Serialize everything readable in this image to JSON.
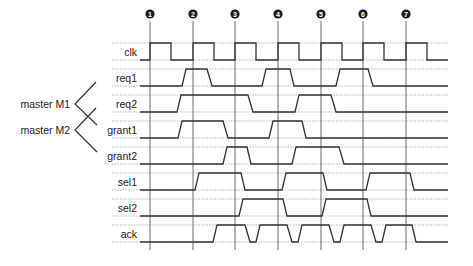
{
  "diagram": {
    "type": "timing-diagram",
    "markers": [
      {
        "label": "1",
        "x": 150
      },
      {
        "label": "2",
        "x": 193
      },
      {
        "label": "3",
        "x": 235
      },
      {
        "label": "4",
        "x": 278
      },
      {
        "label": "5",
        "x": 321
      },
      {
        "label": "6",
        "x": 363
      },
      {
        "label": "7",
        "x": 406
      }
    ],
    "x_start": 140,
    "x_end": 448,
    "groups": [
      {
        "label": "master M1",
        "signals": [
          "req1",
          "grant1"
        ]
      },
      {
        "label": "master M2",
        "signals": [
          "req2",
          "grant2"
        ]
      }
    ],
    "signals": [
      {
        "name": "clk",
        "high_y": 43,
        "low_y": 60,
        "edges": [
          [
            140,
            0
          ],
          [
            150,
            0
          ],
          [
            150,
            1
          ],
          [
            171,
            1
          ],
          [
            171,
            0
          ],
          [
            193,
            0
          ],
          [
            193,
            1
          ],
          [
            214,
            1
          ],
          [
            214,
            0
          ],
          [
            235,
            0
          ],
          [
            235,
            1
          ],
          [
            256,
            1
          ],
          [
            256,
            0
          ],
          [
            278,
            0
          ],
          [
            278,
            1
          ],
          [
            299,
            1
          ],
          [
            299,
            0
          ],
          [
            321,
            0
          ],
          [
            321,
            1
          ],
          [
            342,
            1
          ],
          [
            342,
            0
          ],
          [
            363,
            0
          ],
          [
            363,
            1
          ],
          [
            384,
            1
          ],
          [
            384,
            0
          ],
          [
            406,
            0
          ],
          [
            406,
            1
          ],
          [
            427,
            1
          ],
          [
            427,
            0
          ],
          [
            448,
            0
          ]
        ]
      },
      {
        "name": "req1",
        "high_y": 69,
        "low_y": 86,
        "edges": [
          [
            140,
            0
          ],
          [
            182,
            0
          ],
          [
            186,
            1
          ],
          [
            207,
            1
          ],
          [
            212,
            0
          ],
          [
            262,
            0
          ],
          [
            266,
            1
          ],
          [
            290,
            1
          ],
          [
            294,
            0
          ],
          [
            336,
            0
          ],
          [
            340,
            1
          ],
          [
            368,
            1
          ],
          [
            373,
            0
          ],
          [
            448,
            0
          ]
        ]
      },
      {
        "name": "req2",
        "high_y": 95,
        "low_y": 112,
        "edges": [
          [
            140,
            0
          ],
          [
            177,
            0
          ],
          [
            181,
            1
          ],
          [
            248,
            1
          ],
          [
            253,
            0
          ],
          [
            295,
            0
          ],
          [
            299,
            1
          ],
          [
            331,
            1
          ],
          [
            336,
            0
          ],
          [
            448,
            0
          ]
        ]
      },
      {
        "name": "grant1",
        "high_y": 121,
        "low_y": 138,
        "edges": [
          [
            140,
            0
          ],
          [
            178,
            0
          ],
          [
            182,
            1
          ],
          [
            223,
            1
          ],
          [
            228,
            0
          ],
          [
            269,
            0
          ],
          [
            273,
            1
          ],
          [
            302,
            1
          ],
          [
            306,
            0
          ],
          [
            448,
            0
          ]
        ]
      },
      {
        "name": "grant2",
        "high_y": 147,
        "low_y": 164,
        "edges": [
          [
            140,
            0
          ],
          [
            223,
            0
          ],
          [
            227,
            1
          ],
          [
            247,
            1
          ],
          [
            251,
            0
          ],
          [
            292,
            0
          ],
          [
            296,
            1
          ],
          [
            339,
            1
          ],
          [
            344,
            0
          ],
          [
            448,
            0
          ]
        ]
      },
      {
        "name": "sel1",
        "high_y": 173,
        "low_y": 190,
        "edges": [
          [
            140,
            0
          ],
          [
            195,
            0
          ],
          [
            199,
            1
          ],
          [
            241,
            1
          ],
          [
            245,
            0
          ],
          [
            282,
            0
          ],
          [
            286,
            1
          ],
          [
            323,
            1
          ],
          [
            327,
            0
          ],
          [
            366,
            0
          ],
          [
            370,
            1
          ],
          [
            410,
            1
          ],
          [
            414,
            0
          ],
          [
            448,
            0
          ]
        ]
      },
      {
        "name": "sel2",
        "high_y": 199,
        "low_y": 216,
        "edges": [
          [
            140,
            0
          ],
          [
            239,
            0
          ],
          [
            243,
            1
          ],
          [
            283,
            1
          ],
          [
            287,
            0
          ],
          [
            322,
            0
          ],
          [
            326,
            1
          ],
          [
            367,
            1
          ],
          [
            371,
            0
          ],
          [
            448,
            0
          ]
        ]
      },
      {
        "name": "ack",
        "high_y": 225,
        "low_y": 242,
        "edges": [
          [
            140,
            0
          ],
          [
            213,
            0
          ],
          [
            217,
            1
          ],
          [
            245,
            1
          ],
          [
            250,
            0
          ],
          [
            256,
            0
          ],
          [
            260,
            1
          ],
          [
            287,
            1
          ],
          [
            292,
            0
          ],
          [
            298,
            0
          ],
          [
            302,
            1
          ],
          [
            329,
            1
          ],
          [
            334,
            0
          ],
          [
            340,
            0
          ],
          [
            344,
            1
          ],
          [
            371,
            1
          ],
          [
            376,
            0
          ],
          [
            382,
            0
          ],
          [
            386,
            1
          ],
          [
            412,
            1
          ],
          [
            416,
            0
          ],
          [
            448,
            0
          ]
        ]
      }
    ]
  }
}
